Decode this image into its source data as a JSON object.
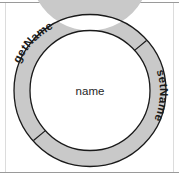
{
  "figure": {
    "canvas": {
      "width": 179,
      "height": 186
    },
    "background_color": "#ffffff"
  },
  "frame": {
    "top_rule_color": "#9a9a9a",
    "bottom_rule_color": "#9a9a9a",
    "side_rule_color": "#d8d8d8"
  },
  "ring": {
    "center_x": 90,
    "center_y": 90.5,
    "outer_radius": 76,
    "inner_radius": 60,
    "fill_color": "#c9c9c9",
    "stroke_color": "#1a1a1a",
    "stroke_width": 1.2,
    "inner_fill_color": "#ffffff",
    "divider_color": "#1a1a1a",
    "divider_angles_deg": [
      48,
      228
    ]
  },
  "labels": {
    "center": "name",
    "arc_top_left": "getName",
    "arc_bottom_right": "setName",
    "text_color": "#1f1f1f"
  },
  "segments": [
    {
      "name": "getName",
      "start_angle_deg": 228,
      "end_angle_deg": 48
    },
    {
      "name": "setName",
      "start_angle_deg": 48,
      "end_angle_deg": 228
    }
  ]
}
